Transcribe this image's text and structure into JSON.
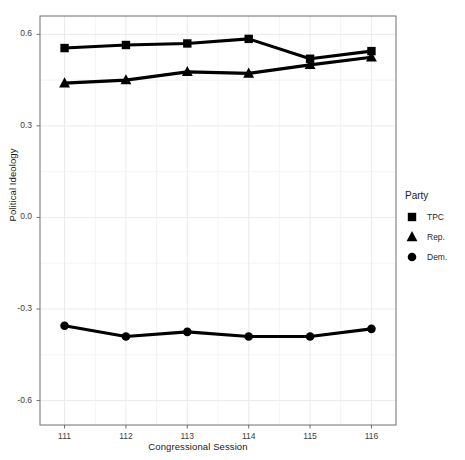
{
  "chart_data": {
    "type": "line",
    "title": "",
    "xlabel": "Congressional Session",
    "ylabel": "Political Ideology",
    "categories": [
      "111",
      "112",
      "113",
      "114",
      "115",
      "116"
    ],
    "x": [
      111,
      112,
      113,
      114,
      115,
      116
    ],
    "xlim": [
      110.6,
      116.4
    ],
    "ylim": [
      -0.68,
      0.66
    ],
    "yticks": [
      0.6,
      0.3,
      0.0,
      -0.3,
      -0.6
    ],
    "ytick_labels": [
      "0.6",
      "0.3",
      "0.0",
      "-0.3",
      "-0.6"
    ],
    "xticks": [
      111,
      112,
      113,
      114,
      115,
      116
    ],
    "xtick_labels": [
      "111",
      "112",
      "113",
      "114",
      "115",
      "116"
    ],
    "grid": true,
    "legend_position": "right",
    "legend_title": "Party",
    "series": [
      {
        "name": "TPC",
        "marker": "square",
        "color": "#000000",
        "values": [
          0.555,
          0.565,
          0.57,
          0.585,
          0.52,
          0.545
        ]
      },
      {
        "name": "Rep.",
        "marker": "triangle",
        "color": "#000000",
        "values": [
          0.44,
          0.45,
          0.477,
          0.472,
          0.5,
          0.525
        ]
      },
      {
        "name": "Dem.",
        "marker": "circle",
        "color": "#000000",
        "values": [
          -0.355,
          -0.39,
          -0.375,
          -0.39,
          -0.39,
          -0.365
        ]
      }
    ]
  },
  "legend": {
    "title": "Party",
    "items": [
      {
        "label": "TPC",
        "marker": "square-marker-icon"
      },
      {
        "label": "Rep.",
        "marker": "triangle-marker-icon"
      },
      {
        "label": "Dem.",
        "marker": "circle-marker-icon"
      }
    ]
  },
  "axes": {
    "x_title": "Congressional Session",
    "y_title": "Political Ideology"
  },
  "style": {
    "panel_background": "#ffffff",
    "panel_border": "#6f6f6f",
    "grid_color": "#ebebeb",
    "series_color": "#000000",
    "text_color": "#1a1a1a",
    "tick_color": "#3d3d3d"
  }
}
